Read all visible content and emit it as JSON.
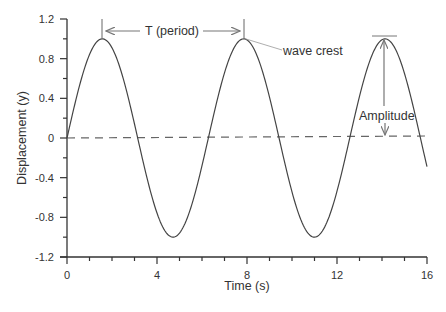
{
  "chart_data": {
    "type": "line",
    "title": "",
    "xlabel": "Time (s)",
    "ylabel": "Displacement (y)",
    "xlim": [
      0,
      16
    ],
    "ylim": [
      -1.2,
      1.2
    ],
    "x_ticks": [
      "0",
      "4",
      "8",
      "12",
      "16"
    ],
    "y_ticks": [
      "1.2",
      "0.8",
      "0.4",
      "0",
      "-0.4",
      "-0.8",
      "-1.2"
    ],
    "grid": false,
    "series": [
      {
        "name": "wave",
        "function": "y = sin(t)",
        "x": [
          0,
          1,
          1.57,
          2,
          3,
          3.14,
          4,
          4.71,
          5,
          6,
          6.28,
          7,
          7.85,
          8,
          9,
          9.42,
          10,
          11,
          11,
          12,
          12.57,
          13,
          14,
          14.14,
          15,
          16
        ],
        "values": [
          0,
          0.84,
          1.0,
          0.91,
          0.14,
          0,
          -0.76,
          -1.0,
          -0.96,
          -0.28,
          0,
          0.66,
          1.0,
          0.99,
          0.41,
          0,
          -0.54,
          -1.0,
          -1.0,
          -0.54,
          0,
          0.42,
          0.99,
          1.0,
          0.65,
          -0.29
        ]
      },
      {
        "name": "equilibrium",
        "style": "dashed",
        "x": [
          0,
          16
        ],
        "values": [
          0,
          0
        ]
      }
    ],
    "annotations": [
      {
        "text": "T (period)",
        "type": "double-arrow",
        "from_x": 1.57,
        "to_x": 7.85,
        "y": 1.1
      },
      {
        "text": "wave crest",
        "type": "leader-line",
        "target_x": 7.85,
        "target_y": 1.0
      },
      {
        "text": "Amplitude",
        "type": "double-arrow-vertical",
        "x": 14.14,
        "from_y": 0,
        "to_y": 1.0
      }
    ]
  },
  "labels": {
    "xlabel": "Time (s)",
    "ylabel": "Displacement (y)",
    "period": "T (period)",
    "crest": "wave crest",
    "amplitude": "Amplitude"
  },
  "ticks": {
    "x": [
      "0",
      "4",
      "8",
      "12",
      "16"
    ],
    "y": [
      "1.2",
      "0.8",
      "0.4",
      "0",
      "-0.4",
      "-0.8",
      "-1.2"
    ]
  },
  "colors": {
    "curve": "#444444",
    "axis": "#333333",
    "annotation": "#777777"
  }
}
